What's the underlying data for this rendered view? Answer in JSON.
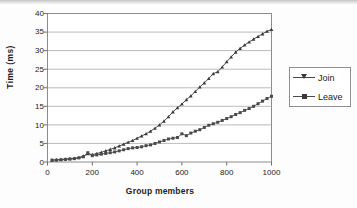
{
  "chart_data": {
    "type": "line",
    "title": "",
    "xlabel": "Group members",
    "ylabel": "Time (ms)",
    "xlim": [
      0,
      1000
    ],
    "ylim": [
      0,
      40
    ],
    "xticks": [
      0,
      200,
      400,
      600,
      800,
      1000
    ],
    "yticks": [
      0,
      5,
      10,
      15,
      20,
      25,
      30,
      35,
      40
    ],
    "grid": "horizontal",
    "legend_position": "right",
    "x": [
      20,
      40,
      60,
      80,
      100,
      120,
      140,
      160,
      180,
      200,
      220,
      240,
      260,
      280,
      300,
      320,
      340,
      360,
      380,
      400,
      420,
      440,
      460,
      480,
      500,
      520,
      540,
      560,
      580,
      600,
      620,
      640,
      660,
      680,
      700,
      720,
      740,
      760,
      780,
      800,
      820,
      840,
      860,
      880,
      900,
      920,
      940,
      960,
      980,
      1000
    ],
    "series": [
      {
        "name": "Join",
        "marker": "triangle",
        "color": "#3a3a3a",
        "values": [
          0.5,
          0.6,
          0.7,
          0.8,
          0.9,
          1.0,
          1.2,
          1.6,
          2.2,
          2.0,
          2.3,
          2.6,
          3.0,
          3.4,
          3.8,
          4.3,
          4.8,
          5.3,
          5.8,
          6.4,
          7.0,
          7.6,
          8.3,
          9.1,
          10.0,
          11.0,
          12.2,
          13.5,
          14.6,
          15.6,
          16.8,
          17.8,
          19.0,
          20.2,
          21.3,
          22.5,
          23.8,
          24.3,
          25.6,
          27.0,
          28.3,
          29.6,
          30.6,
          31.5,
          32.3,
          33.1,
          33.8,
          34.5,
          35.2,
          35.7
        ]
      },
      {
        "name": "Leave",
        "marker": "square",
        "color": "#4a4a4a",
        "values": [
          0.5,
          0.5,
          0.6,
          0.7,
          0.8,
          0.9,
          1.1,
          1.4,
          2.5,
          1.7,
          1.9,
          2.1,
          2.3,
          2.5,
          2.7,
          3.0,
          3.3,
          3.6,
          3.8,
          3.9,
          4.1,
          4.4,
          4.6,
          5.0,
          5.4,
          5.8,
          6.2,
          6.4,
          6.6,
          7.6,
          7.1,
          7.8,
          8.3,
          8.7,
          9.3,
          9.9,
          10.3,
          10.7,
          11.2,
          11.7,
          12.2,
          12.8,
          13.3,
          13.9,
          14.4,
          15.0,
          15.7,
          16.4,
          17.1,
          17.7
        ]
      }
    ],
    "legend": [
      "Join",
      "Leave"
    ]
  },
  "axis": {
    "yticks": [
      "0",
      "5",
      "10",
      "15",
      "20",
      "25",
      "30",
      "35",
      "40"
    ],
    "xticks": [
      "0",
      "200",
      "400",
      "600",
      "800",
      "1000"
    ]
  },
  "legend": {
    "items": [
      {
        "label": "Join"
      },
      {
        "label": "Leave"
      }
    ]
  }
}
